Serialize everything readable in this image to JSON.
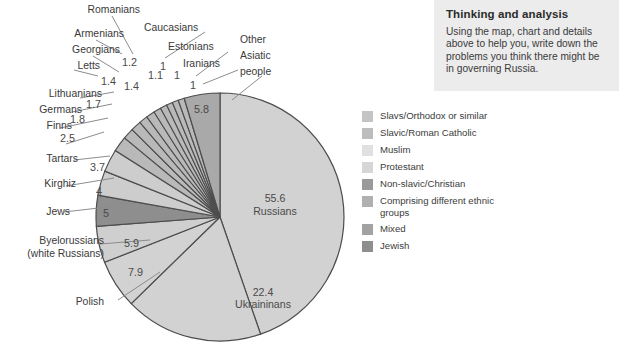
{
  "think_panel": {
    "title": "Thinking and analysis",
    "body": "Using the map, chart and details above to help you, write down the problems you think there might be in governing Russia."
  },
  "legend": {
    "items": [
      {
        "label": "Slavs/Orthodox or similar",
        "color": "#c4c4c4"
      },
      {
        "label": "Slavic/Roman Catholic",
        "color": "#bdbdbd"
      },
      {
        "label": "Muslim",
        "color": "#e0e0e0"
      },
      {
        "label": "Protestant",
        "color": "#d6d6d6"
      },
      {
        "label": "Non-slavic/Christian",
        "color": "#9a9a9a"
      },
      {
        "label": "Comprising different ethnic groups",
        "color": "#b0b0b0"
      },
      {
        "label": "Mixed",
        "color": "#a2a2a2"
      },
      {
        "label": "Jewish",
        "color": "#8e8e8e"
      }
    ]
  },
  "chart_data": {
    "type": "pie",
    "title": "",
    "units": "percent",
    "legend_position": "right",
    "center": {
      "x": 220,
      "y": 217
    },
    "radius": 124,
    "start_angle_deg": -90,
    "categories": [
      "Russians",
      "Ukraininans",
      "Polish",
      "Byelorussians (white Russians)",
      "Jews",
      "Kirghiz",
      "Tartars",
      "Finns",
      "Germans",
      "Lithuanians",
      "Letts",
      "Georgians",
      "Armenians",
      "Romanians",
      "Caucasians",
      "Estonians",
      "Iranians",
      "Other Asiatic people"
    ],
    "values": [
      55.6,
      22.4,
      7.9,
      5.9,
      5,
      4,
      3.7,
      2.5,
      1.8,
      1.7,
      1.4,
      1.4,
      1.2,
      1.1,
      1,
      1,
      1,
      5.8
    ],
    "value_labels": [
      "55.6",
      "22.4",
      "7.9",
      "5.9",
      "5",
      "4",
      "3.7",
      "2.5",
      "1.8",
      "1.7",
      "1.4",
      "1.4",
      "1.2",
      "1.1",
      "1",
      "1",
      "1",
      "5.8"
    ],
    "colors": [
      "#d2d2d2",
      "#d2d2d2",
      "#d2d2d2",
      "#cfcfcf",
      "#8e8e8e",
      "#cdcdcd",
      "#cdcdcd",
      "#b9b9b9",
      "#b9b9b9",
      "#b9b9b9",
      "#b9b9b9",
      "#b9b9b9",
      "#b9b9b9",
      "#b9b9b9",
      "#b9b9b9",
      "#b9b9b9",
      "#b9b9b9",
      "#a9a9a9"
    ],
    "inside_labels": [
      {
        "value": "55.6",
        "name": "Russians"
      },
      {
        "value": "22.4",
        "name": "Ukraininans"
      },
      {
        "value": "5.8",
        "name": ""
      }
    ],
    "outside_labels": [
      "Romanians",
      "Caucasians",
      "Armenians",
      "Georgians",
      "Estonians",
      "Iranians",
      "Letts",
      "Lithuanians",
      "Germans",
      "Finns",
      "Tartars",
      "Kirghiz",
      "Jews",
      "Byelorussians (white Russians)",
      "Polish",
      "Other Asiatic people"
    ]
  },
  "labels": {
    "romanians": "Romanians",
    "caucasians": "Caucasians",
    "armenians": "Armenians",
    "georgians": "Georgians",
    "estonians": "Estonians",
    "iranians": "Iranians",
    "letts": "Letts",
    "lithuanians": "Lithuanians",
    "germans": "Germans",
    "finns": "Finns",
    "tartars": "Tartars",
    "kirghiz": "Kirghiz",
    "jews": "Jews",
    "byelorussians_1": "Byelorussians",
    "byelorussians_2": "(white Russians)",
    "polish": "Polish",
    "other_asiatic_1": "Other",
    "other_asiatic_2": "Asiatic",
    "other_asiatic_3": "people"
  },
  "numbers": {
    "n_1_2": "1.2",
    "n_1_1": "1.1",
    "n_1_a": "1",
    "n_1_b": "1",
    "n_1_c": "1",
    "n_1_4a": "1.4",
    "n_1_4b": "1.4",
    "n_1_7": "1.7",
    "n_1_8": "1.8",
    "n_2_5": "2.5",
    "n_3_7": "3.7",
    "n_4": "4",
    "n_5": "5",
    "n_5_8": "5.8",
    "n_5_9": "5.9",
    "n_7_9": "7.9",
    "n_22_4": "22.4",
    "n_55_6": "55.6",
    "name_russians": "Russians",
    "name_ukraininans": "Ukraininans"
  }
}
